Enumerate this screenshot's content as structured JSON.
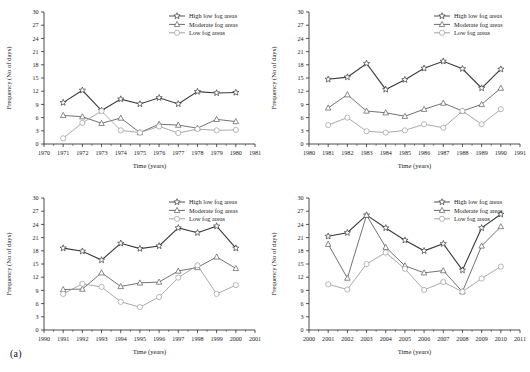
{
  "figure": {
    "caption": "(a)",
    "panel_count": 4
  },
  "legend": {
    "entries": [
      {
        "label": "High low fog areas",
        "marker": "star",
        "color": "#3a3a3a"
      },
      {
        "label": "Moderate fog areas",
        "marker": "triangle",
        "color": "#5a5a5a"
      },
      {
        "label": "Low fog areas",
        "marker": "circle",
        "color": "#9a9a9a"
      }
    ]
  },
  "axes": {
    "ylabel": "Frequency (No of days)",
    "xlabel": "Time (years)",
    "yticks": [
      0,
      3,
      6,
      9,
      12,
      15,
      18,
      21,
      24,
      27,
      30
    ]
  },
  "chart_data": [
    {
      "id": "panel-1971-1980",
      "type": "line",
      "title": "",
      "xlabel": "Time (years)",
      "ylabel": "Frequency (No of days)",
      "xlim": [
        1970,
        1981
      ],
      "ylim": [
        0,
        30
      ],
      "grid": false,
      "legend_position": "top-right",
      "xticks": [
        1970,
        1971,
        1972,
        1973,
        1974,
        1975,
        1976,
        1977,
        1978,
        1979,
        1980,
        1981
      ],
      "categories": [
        1971,
        1972,
        1973,
        1974,
        1975,
        1976,
        1977,
        1978,
        1979,
        1980
      ],
      "series": [
        {
          "name": "High low fog areas",
          "marker": "star",
          "color": "#3a3a3a",
          "values": [
            9.4,
            12.2,
            7.6,
            10.2,
            9.1,
            10.5,
            9.1,
            11.9,
            11.6,
            11.7
          ]
        },
        {
          "name": "Moderate fog areas",
          "marker": "triangle",
          "color": "#5a5a5a",
          "values": [
            6.5,
            6.2,
            4.7,
            5.9,
            2.6,
            4.5,
            4.3,
            3.6,
            5.6,
            5.1
          ]
        },
        {
          "name": "Low fog areas",
          "marker": "circle",
          "color": "#9a9a9a",
          "values": [
            1.3,
            4.8,
            7.5,
            3.1,
            2.6,
            4.0,
            2.5,
            3.4,
            3.1,
            3.2
          ]
        }
      ]
    },
    {
      "id": "panel-1981-1990",
      "type": "line",
      "title": "",
      "xlabel": "Time (years)",
      "ylabel": "Frequency (No of days)",
      "xlim": [
        1980,
        1991
      ],
      "ylim": [
        0,
        30
      ],
      "grid": false,
      "legend_position": "top-right",
      "xticks": [
        1980,
        1981,
        1982,
        1983,
        1984,
        1985,
        1986,
        1987,
        1988,
        1989,
        1990,
        1991
      ],
      "categories": [
        1981,
        1982,
        1983,
        1984,
        1985,
        1986,
        1987,
        1988,
        1989,
        1990
      ],
      "series": [
        {
          "name": "High low fog areas",
          "marker": "star",
          "color": "#3a3a3a",
          "values": [
            14.7,
            15.2,
            18.3,
            12.4,
            14.6,
            17.2,
            18.8,
            17.1,
            12.7,
            17.0
          ]
        },
        {
          "name": "Moderate fog areas",
          "marker": "triangle",
          "color": "#5a5a5a",
          "values": [
            8.2,
            11.2,
            7.5,
            7.1,
            6.3,
            7.9,
            9.3,
            7.5,
            9.0,
            12.7
          ]
        },
        {
          "name": "Low fog areas",
          "marker": "circle",
          "color": "#9a9a9a",
          "values": [
            4.3,
            6.0,
            2.9,
            2.6,
            3.1,
            4.5,
            3.7,
            7.5,
            4.5,
            7.9
          ]
        }
      ]
    },
    {
      "id": "panel-1991-2000",
      "type": "line",
      "title": "",
      "xlabel": "Time (years)",
      "ylabel": "Frequency (No of days)",
      "xlim": [
        1990,
        2001
      ],
      "ylim": [
        0,
        30
      ],
      "grid": false,
      "legend_position": "top-right",
      "xticks": [
        1990,
        1991,
        1992,
        1993,
        1994,
        1995,
        1996,
        1997,
        1998,
        1999,
        2000,
        2001
      ],
      "categories": [
        1991,
        1992,
        1993,
        1994,
        1995,
        1996,
        1997,
        1998,
        1999,
        2000
      ],
      "series": [
        {
          "name": "High low fog areas",
          "marker": "star",
          "color": "#3a3a3a",
          "values": [
            18.6,
            17.9,
            15.9,
            19.7,
            18.5,
            19.1,
            23.2,
            22.1,
            23.6,
            18.6
          ]
        },
        {
          "name": "Moderate fog areas",
          "marker": "triangle",
          "color": "#5a5a5a",
          "values": [
            9.2,
            9.3,
            13.0,
            9.9,
            10.7,
            10.9,
            13.4,
            14.2,
            16.6,
            14.0
          ]
        },
        {
          "name": "Low fog areas",
          "marker": "circle",
          "color": "#9a9a9a",
          "values": [
            8.2,
            10.5,
            9.8,
            6.4,
            5.2,
            7.5,
            11.9,
            14.7,
            8.2,
            10.2
          ]
        }
      ]
    },
    {
      "id": "panel-2001-2010",
      "type": "line",
      "title": "",
      "xlabel": "Time (years)",
      "ylabel": "Frequency (No of days)",
      "xlim": [
        2000,
        2011
      ],
      "ylim": [
        0,
        30
      ],
      "grid": false,
      "legend_position": "top-right",
      "xticks": [
        2000,
        2001,
        2002,
        2003,
        2004,
        2005,
        2006,
        2007,
        2008,
        2009,
        2010,
        2011
      ],
      "categories": [
        2001,
        2002,
        2003,
        2004,
        2005,
        2006,
        2007,
        2008,
        2009,
        2010
      ],
      "series": [
        {
          "name": "High low fog areas",
          "marker": "star",
          "color": "#3a3a3a",
          "values": [
            21.3,
            22.1,
            26.1,
            23.2,
            20.4,
            18.0,
            19.6,
            13.6,
            23.2,
            26.3
          ]
        },
        {
          "name": "Moderate fog areas",
          "marker": "triangle",
          "color": "#5a5a5a",
          "values": [
            19.5,
            11.8,
            26.1,
            18.8,
            14.6,
            13.0,
            13.5,
            8.7,
            19.1,
            23.5
          ]
        },
        {
          "name": "Low fog areas",
          "marker": "circle",
          "color": "#9a9a9a",
          "values": [
            10.4,
            9.2,
            15.0,
            17.6,
            13.9,
            9.1,
            10.9,
            8.7,
            11.7,
            14.4
          ]
        }
      ]
    }
  ]
}
